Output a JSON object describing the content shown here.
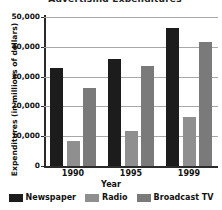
{
  "chart_data": {
    "type": "bar",
    "title": "Advertising Expenditures",
    "title_visible": false,
    "xlabel": "Year",
    "ylabel": "Expenditures (in millions of dollars)",
    "categories": [
      "1990",
      "1995",
      "1999"
    ],
    "series": [
      {
        "name": "Newspaper",
        "color": "#1c1c1c",
        "values": [
          32800,
          36000,
          46300
        ]
      },
      {
        "name": "Radio",
        "color": "#8f8f8f",
        "values": [
          8300,
          11900,
          16400
        ]
      },
      {
        "name": "Broadcast TV",
        "color": "#7a7a7a",
        "values": [
          26200,
          33400,
          41600
        ]
      }
    ],
    "ylim": [
      0,
      50000
    ],
    "ytick_values": [
      0,
      10000,
      20000,
      30000,
      40000,
      50000
    ],
    "ytick_labels": [
      "0",
      "10,000",
      "20,000",
      "30,000",
      "40,000",
      "50,000"
    ],
    "grid": true,
    "grid_axis": "y",
    "legend_position": "bottom",
    "background_color": "#ffffff",
    "grid_color": "#a8a8a8",
    "axis_color": "#2b2b2b"
  }
}
